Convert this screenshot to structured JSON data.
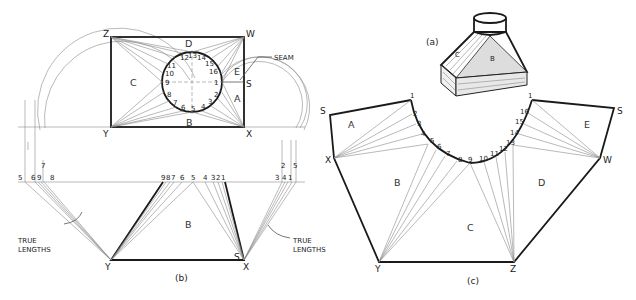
{
  "figure": {
    "parts": {
      "a": {
        "caption": "(a)",
        "face_labels": [
          "C",
          "B"
        ]
      },
      "b": {
        "caption": "(b)",
        "corners": {
          "z": "Z",
          "w": "W",
          "y": "Y",
          "x": "X",
          "s": "S"
        },
        "faces": {
          "a": "A",
          "b": "B",
          "c": "C",
          "d": "D",
          "e": "E"
        },
        "seam_label": "SEAM",
        "circle_points": [
          "1",
          "2",
          "3",
          "4",
          "5",
          "6",
          "7",
          "8",
          "9",
          "10",
          "11",
          "12",
          "13",
          "14",
          "15",
          "16"
        ],
        "true_lengths_label_line1": "TRUE",
        "true_lengths_label_line2": "LENGTHS",
        "left_tl_points": [
          "5",
          "6",
          "9",
          "8",
          "7"
        ],
        "center_tl_points": [
          "9",
          "8",
          "7",
          "6",
          "5",
          "4",
          "3",
          "2",
          "1"
        ],
        "right_tl_points": [
          "3",
          "4",
          "1",
          "2",
          "5"
        ]
      },
      "c": {
        "caption": "(c)",
        "corners": {
          "s_left": "S",
          "s_right": "S",
          "x": "X",
          "w": "W",
          "y": "Y",
          "z": "Z"
        },
        "faces": {
          "a": "A",
          "b": "B",
          "c": "C",
          "d": "D",
          "e": "E"
        },
        "arc_points": [
          "1",
          "2",
          "3",
          "4",
          "5",
          "6",
          "7",
          "8",
          "9",
          "10",
          "11",
          "12",
          "13",
          "14",
          "15",
          "16",
          "1"
        ]
      }
    }
  }
}
